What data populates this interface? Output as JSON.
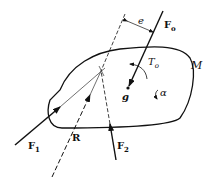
{
  "diagram": {
    "type": "rigid-body-force-diagram",
    "body_label": "M",
    "forces": [
      {
        "id": "F1",
        "label": "F",
        "sub": "1"
      },
      {
        "id": "F2",
        "label": "F",
        "sub": "2"
      },
      {
        "id": "Fo",
        "label": "F",
        "sub": "o"
      },
      {
        "id": "R",
        "label": "R",
        "sub": ""
      }
    ],
    "torque": {
      "label": "T",
      "sub": "o"
    },
    "center_of_mass": "g",
    "angular_acceleration": "α",
    "eccentricity": "e"
  }
}
